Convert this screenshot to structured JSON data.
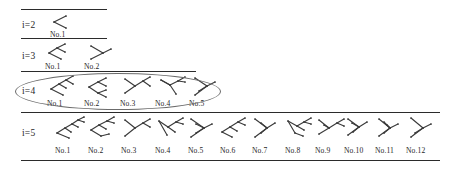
{
  "figure": {
    "background_color": "#ffffff",
    "ink_color": "#3a3a3a",
    "rule_color": "#2b2b2b",
    "highlight_color": "#6b6b6b",
    "width": 458,
    "height": 173
  },
  "rules": [
    {
      "name": "rule-top",
      "x": 21,
      "y": 9,
      "width": 86
    },
    {
      "name": "rule-below-i2",
      "x": 21,
      "y": 38,
      "width": 86
    },
    {
      "name": "rule-below-i3",
      "x": 21,
      "y": 71,
      "width": 175
    },
    {
      "name": "rule-below-i4",
      "x": 21,
      "y": 112,
      "width": 419
    },
    {
      "name": "rule-bottom",
      "x": 21,
      "y": 160,
      "width": 419
    }
  ],
  "highlight": {
    "label": "i=4-row-highlight",
    "x": 15,
    "y": 73,
    "width": 204,
    "height": 35
  },
  "rows": [
    {
      "id": "i2",
      "label": "i=2",
      "label_x": 22,
      "label_y": 20,
      "count": 1,
      "items": [
        {
          "label": "No.1",
          "x": 52,
          "y": 13,
          "label_x": 50,
          "leaves": 2,
          "shape": "fork"
        }
      ]
    },
    {
      "id": "i3",
      "label": "i=3",
      "label_x": 22,
      "label_y": 51,
      "count": 2,
      "items": [
        {
          "label": "No.1",
          "x": 48,
          "y": 42,
          "label_x": 45,
          "leaves": 3,
          "shape": "comb-left"
        },
        {
          "label": "No.2",
          "x": 90,
          "y": 42,
          "label_x": 84,
          "leaves": 3,
          "shape": "comb-right"
        }
      ]
    },
    {
      "id": "i4",
      "label": "i=4",
      "label_x": 22,
      "label_y": 86,
      "count": 5,
      "items": [
        {
          "label": "No.1",
          "x": 50,
          "y": 75,
          "label_x": 47,
          "leaves": 4,
          "shape": "comb-a"
        },
        {
          "label": "No.2",
          "x": 88,
          "y": 75,
          "label_x": 84,
          "leaves": 4,
          "shape": "comb-b"
        },
        {
          "label": "No.3",
          "x": 124,
          "y": 75,
          "label_x": 120,
          "leaves": 4,
          "shape": "comb-c"
        },
        {
          "label": "No.4",
          "x": 160,
          "y": 75,
          "label_x": 155,
          "leaves": 4,
          "shape": "comb-d"
        },
        {
          "label": "No.5",
          "x": 194,
          "y": 75,
          "label_x": 189,
          "leaves": 4,
          "shape": "comb-e"
        }
      ]
    },
    {
      "id": "i5",
      "label": "i=5",
      "label_x": 22,
      "label_y": 128,
      "count": 12,
      "items": [
        {
          "label": "No.1",
          "x": 57,
          "y": 116,
          "label_x": 55,
          "leaves": 5,
          "shape": "s1"
        },
        {
          "label": "No.2",
          "x": 90,
          "y": 116,
          "label_x": 88,
          "leaves": 5,
          "shape": "s2"
        },
        {
          "label": "No.3",
          "x": 124,
          "y": 116,
          "label_x": 121,
          "leaves": 5,
          "shape": "s3"
        },
        {
          "label": "No.4",
          "x": 158,
          "y": 116,
          "label_x": 155,
          "leaves": 5,
          "shape": "s4"
        },
        {
          "label": "No.5",
          "x": 190,
          "y": 116,
          "label_x": 188,
          "leaves": 5,
          "shape": "s5"
        },
        {
          "label": "No.6",
          "x": 222,
          "y": 116,
          "label_x": 220,
          "leaves": 5,
          "shape": "s6"
        },
        {
          "label": "No.7",
          "x": 254,
          "y": 116,
          "label_x": 252,
          "leaves": 5,
          "shape": "s7"
        },
        {
          "label": "No.8",
          "x": 288,
          "y": 116,
          "label_x": 285,
          "leaves": 5,
          "shape": "s8"
        },
        {
          "label": "No.9",
          "x": 318,
          "y": 116,
          "label_x": 315,
          "leaves": 5,
          "shape": "s9"
        },
        {
          "label": "No.10",
          "x": 347,
          "y": 116,
          "label_x": 344,
          "leaves": 5,
          "shape": "s10"
        },
        {
          "label": "No.11",
          "x": 378,
          "y": 116,
          "label_x": 375,
          "leaves": 5,
          "shape": "s11"
        },
        {
          "label": "No.12",
          "x": 410,
          "y": 116,
          "label_x": 406,
          "leaves": 5,
          "shape": "s12"
        }
      ]
    }
  ],
  "shapes": {
    "fork": [
      [
        2,
        9,
        14,
        3
      ],
      [
        2,
        9,
        14,
        15
      ]
    ],
    "comb-left": [
      [
        1,
        11,
        9,
        6
      ],
      [
        9,
        6,
        17,
        2
      ],
      [
        9,
        6,
        17,
        10
      ],
      [
        1,
        11,
        13,
        17
      ]
    ],
    "comb-right": [
      [
        1,
        4,
        13,
        11
      ],
      [
        1,
        17,
        13,
        11
      ],
      [
        13,
        11,
        21,
        7
      ]
    ],
    "comb-a": [
      [
        1,
        14,
        9,
        9
      ],
      [
        9,
        9,
        16,
        5
      ],
      [
        16,
        5,
        23,
        1
      ],
      [
        16,
        5,
        23,
        9
      ],
      [
        9,
        9,
        16,
        13
      ],
      [
        1,
        14,
        13,
        20
      ]
    ],
    "comb-b": [
      [
        1,
        12,
        10,
        7
      ],
      [
        10,
        7,
        18,
        3
      ],
      [
        10,
        7,
        18,
        11
      ],
      [
        1,
        12,
        10,
        18
      ],
      [
        10,
        18,
        18,
        15
      ],
      [
        10,
        18,
        18,
        22
      ]
    ],
    "comb-c": [
      [
        1,
        4,
        11,
        11
      ],
      [
        1,
        18,
        11,
        11
      ],
      [
        11,
        11,
        19,
        6
      ],
      [
        19,
        6,
        26,
        2
      ],
      [
        19,
        6,
        26,
        11
      ]
    ],
    "comb-d": [
      [
        1,
        5,
        10,
        10
      ],
      [
        10,
        10,
        18,
        6
      ],
      [
        18,
        6,
        25,
        2
      ],
      [
        18,
        6,
        25,
        7
      ],
      [
        10,
        10,
        16,
        19
      ],
      [
        1,
        5,
        10,
        10
      ]
    ],
    "comb-e": [
      [
        1,
        3,
        13,
        11
      ],
      [
        1,
        20,
        13,
        11
      ],
      [
        13,
        11,
        21,
        7
      ],
      [
        5,
        16,
        13,
        11
      ]
    ],
    "s1": [
      [
        0,
        17,
        8,
        12
      ],
      [
        8,
        12,
        15,
        8
      ],
      [
        15,
        8,
        21,
        4
      ],
      [
        21,
        4,
        27,
        1
      ],
      [
        21,
        4,
        27,
        6
      ],
      [
        15,
        8,
        21,
        11
      ],
      [
        8,
        12,
        14,
        16
      ],
      [
        0,
        17,
        12,
        22
      ]
    ],
    "s2": [
      [
        1,
        14,
        9,
        9
      ],
      [
        9,
        9,
        17,
        5
      ],
      [
        17,
        5,
        24,
        1
      ],
      [
        17,
        5,
        24,
        7
      ],
      [
        9,
        9,
        16,
        13
      ],
      [
        1,
        14,
        11,
        20
      ],
      [
        11,
        20,
        19,
        18
      ]
    ],
    "s3": [
      [
        1,
        4,
        11,
        12
      ],
      [
        1,
        20,
        11,
        12
      ],
      [
        11,
        12,
        19,
        7
      ],
      [
        19,
        7,
        26,
        3
      ],
      [
        19,
        7,
        26,
        11
      ]
    ],
    "s4": [
      [
        1,
        5,
        10,
        11
      ],
      [
        10,
        11,
        18,
        6
      ],
      [
        18,
        6,
        25,
        2
      ],
      [
        18,
        6,
        25,
        8
      ],
      [
        10,
        11,
        17,
        16
      ],
      [
        1,
        5,
        9,
        19
      ]
    ],
    "s5": [
      [
        1,
        3,
        14,
        12
      ],
      [
        1,
        21,
        14,
        12
      ],
      [
        14,
        12,
        22,
        8
      ],
      [
        6,
        17,
        14,
        12
      ],
      [
        6,
        8,
        14,
        12
      ]
    ],
    "s6": [
      [
        0,
        16,
        8,
        11
      ],
      [
        8,
        11,
        16,
        6
      ],
      [
        16,
        6,
        23,
        2
      ],
      [
        16,
        6,
        23,
        9
      ],
      [
        8,
        11,
        15,
        15
      ],
      [
        0,
        16,
        10,
        21
      ]
    ],
    "s7": [
      [
        1,
        3,
        13,
        12
      ],
      [
        1,
        21,
        13,
        12
      ],
      [
        13,
        12,
        21,
        7
      ],
      [
        7,
        7,
        13,
        12
      ],
      [
        7,
        17,
        13,
        12
      ]
    ],
    "s8": [
      [
        0,
        5,
        9,
        10
      ],
      [
        9,
        10,
        16,
        6
      ],
      [
        16,
        6,
        23,
        2
      ],
      [
        16,
        6,
        23,
        8
      ],
      [
        9,
        10,
        16,
        14
      ],
      [
        0,
        5,
        7,
        17
      ],
      [
        7,
        17,
        15,
        20
      ]
    ],
    "s9": [
      [
        1,
        4,
        11,
        12
      ],
      [
        11,
        12,
        19,
        7
      ],
      [
        19,
        7,
        26,
        3
      ],
      [
        19,
        7,
        26,
        10
      ],
      [
        1,
        18,
        11,
        12
      ],
      [
        6,
        9,
        11,
        12
      ]
    ],
    "s10": [
      [
        1,
        3,
        12,
        11
      ],
      [
        1,
        19,
        12,
        11
      ],
      [
        12,
        11,
        20,
        6
      ],
      [
        5,
        7,
        12,
        11
      ],
      [
        6,
        16,
        12,
        11
      ]
    ],
    "s11": [
      [
        1,
        3,
        12,
        12
      ],
      [
        1,
        20,
        12,
        12
      ],
      [
        12,
        12,
        20,
        8
      ],
      [
        6,
        6,
        12,
        12
      ],
      [
        6,
        17,
        12,
        12
      ],
      [
        9,
        9,
        12,
        12
      ]
    ],
    "s12": [
      [
        1,
        2,
        13,
        12
      ],
      [
        1,
        21,
        13,
        12
      ],
      [
        13,
        12,
        21,
        8
      ],
      [
        5,
        17,
        13,
        12
      ]
    ]
  }
}
